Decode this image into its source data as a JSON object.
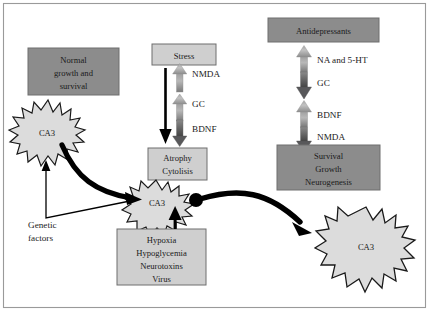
{
  "figure": {
    "colors": {
      "dark_box_fill": "#8c8c8c",
      "light_box_fill": "#cfcfcf",
      "box_stroke": "#6e6e6e",
      "star_fill": "#dcdcdc",
      "star_stroke": "#1a1a1a",
      "arrow_gray_light": "#b4b4b4",
      "arrow_gray_dark": "#6a6a6a",
      "arrow_black": "#000000",
      "frame_stroke": "#9a9a9a",
      "text": "#1a1a1a",
      "page_background": "#ffffff"
    }
  },
  "boxes": {
    "normal_growth": {
      "lines": [
        "Normal",
        "growth and",
        "survival"
      ],
      "style": "dark"
    },
    "stress": {
      "lines": [
        "Stress"
      ],
      "style": "light"
    },
    "antidepressants": {
      "lines": [
        "Antidepressants"
      ],
      "style": "dark"
    },
    "atrophy": {
      "lines": [
        "Atrophy",
        "Cytolisis"
      ],
      "style": "light"
    },
    "survival_growth": {
      "lines": [
        "Survival",
        "Growth",
        "Neurogenesis"
      ],
      "style": "dark"
    },
    "insults": {
      "lines": [
        "Hypoxia",
        "Hypoglycemia",
        "Neurotoxins",
        "Virus"
      ],
      "style": "light"
    }
  },
  "starbursts": [
    {
      "id": "ca3-left",
      "label": "CA3"
    },
    {
      "id": "ca3-center",
      "label": "CA3"
    },
    {
      "id": "ca3-right",
      "label": "CA3"
    }
  ],
  "stress_pathway": {
    "arrows": [
      {
        "label": "NMDA",
        "direction": "up"
      },
      {
        "label": "GC",
        "direction": "up"
      },
      {
        "label": "BDNF",
        "direction": "down"
      }
    ],
    "trunk_arrow_direction": "down"
  },
  "antidepressant_pathway": {
    "arrows": [
      {
        "label": "NA and 5-HT",
        "direction": "up"
      },
      {
        "label": "GC",
        "direction": "down"
      },
      {
        "label": "BDNF",
        "direction": "up"
      },
      {
        "label": "NMDA",
        "direction": "down"
      }
    ]
  },
  "annotations": {
    "genetic_factors": [
      "Genetic",
      "factors"
    ]
  }
}
